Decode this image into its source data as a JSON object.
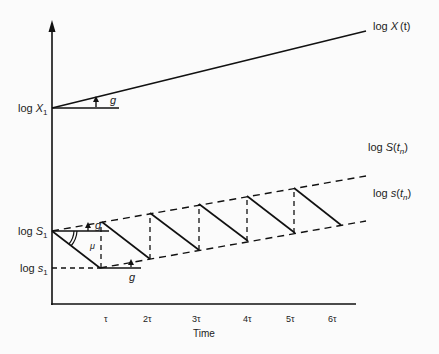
{
  "diagram": {
    "y_labels": {
      "logX1": {
        "prefix": "log ",
        "var": "X",
        "sub": "1"
      },
      "logS1": {
        "prefix": "log ",
        "var": "S",
        "sub": "1"
      },
      "logs1": {
        "prefix": "log ",
        "var": "s",
        "sub": "1"
      }
    },
    "curve_labels": {
      "logXt": {
        "prefix": "log ",
        "var": "X",
        "arg": "(t)"
      },
      "logStn": {
        "prefix": "log ",
        "var": "S",
        "arg_open": "(",
        "arg_var": "t",
        "arg_sub": "n",
        "arg_close": ")"
      },
      "logstn": {
        "prefix": "log ",
        "var": "s",
        "arg_open": "(",
        "arg_var": "t",
        "arg_sub": "n",
        "arg_close": ")"
      }
    },
    "angle_labels": {
      "g_top": "g",
      "g_upper": "g",
      "g_lower": "g",
      "mu": "μ"
    },
    "x_ticks": [
      "τ",
      "2τ",
      "3τ",
      "4τ",
      "5τ",
      "6τ"
    ],
    "x_axis_label": "Time"
  }
}
